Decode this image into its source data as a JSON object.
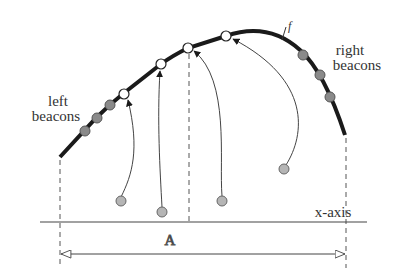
{
  "diagram": {
    "curve_label": "f",
    "left_label_line1": "left",
    "left_label_line2": "beacons",
    "right_label_line1": "right",
    "right_label_line2": "beacons",
    "axis_label": "x-axis",
    "span_label": "A",
    "colors": {
      "curve": "#1a1a1a",
      "beacon_fill": "#8a8a8a",
      "beacon_stroke": "#555555",
      "hollow_fill": "#ffffff",
      "source_fill": "#b5b5b5",
      "line": "#444444"
    },
    "left_beacons": [
      [
        85,
        131
      ],
      [
        97,
        118
      ],
      [
        110,
        105
      ]
    ],
    "right_beacons": [
      [
        303,
        55
      ],
      [
        320,
        75
      ],
      [
        330,
        97
      ]
    ],
    "hollow_points": [
      [
        124,
        94
      ],
      [
        161,
        64
      ],
      [
        188,
        48
      ],
      [
        226,
        36
      ]
    ],
    "source_points": [
      [
        121,
        201
      ],
      [
        162,
        212
      ],
      [
        222,
        201
      ],
      [
        284,
        169
      ]
    ]
  }
}
